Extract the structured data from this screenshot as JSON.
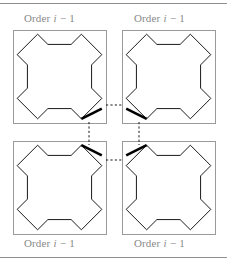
{
  "figure": {
    "title_text_parts": {
      "prefix": "Order ",
      "italic_var": "i",
      "suffix": " − 1"
    },
    "label_full": "Order i − 1",
    "quadrant_labels": [
      {
        "id": "top-left",
        "text_prefix": "Order ",
        "text_italic": "i",
        "text_suffix": " − 1"
      },
      {
        "id": "top-right",
        "text_prefix": "Order ",
        "text_italic": "i",
        "text_suffix": " − 1"
      },
      {
        "id": "bottom-left",
        "text_prefix": "Order ",
        "text_italic": "i",
        "text_suffix": " − 1"
      },
      {
        "id": "bottom-right",
        "text_prefix": "Order ",
        "text_italic": "i",
        "text_suffix": " − 1"
      }
    ],
    "colors": {
      "rule": "#8e8e8e",
      "box_border": "#9a9a9a",
      "curve": "#1a1a1a",
      "thick_segment": "#000000",
      "dashed_connector": "#1a1a1a",
      "label_text": "#8a8a8a",
      "background": "#ffffff"
    },
    "geometry": {
      "canvas_width": 227,
      "canvas_height": 264,
      "rule_top_y": 3,
      "rule_bottom_y": 257,
      "box_size": 93,
      "boxes": [
        {
          "id": "top-left",
          "x": 13,
          "y": 30
        },
        {
          "id": "top-right",
          "x": 122,
          "y": 30
        },
        {
          "id": "bottom-left",
          "x": 13,
          "y": 141
        },
        {
          "id": "bottom-right",
          "x": 122,
          "y": 141
        }
      ],
      "connector_horizontal_top": {
        "x1": 106,
        "y1": 105,
        "x2": 123,
        "y2": 105
      },
      "connector_horizontal_bottom": {
        "x1": 106,
        "y1": 160,
        "x2": 123,
        "y2": 160
      },
      "connector_vertical_left": {
        "x1": 89,
        "y1": 122,
        "x2": 89,
        "y2": 145
      },
      "connector_vertical_right": {
        "x1": 139,
        "y1": 122,
        "x2": 139,
        "y2": 145
      }
    },
    "curve_shape": {
      "description": "octagonal cross (order i-1 space-filling motif)",
      "unit_points": [
        [
          0.3,
          0.02
        ],
        [
          0.18,
          0.14
        ],
        [
          0.3,
          0.26
        ],
        [
          0.3,
          0.3
        ],
        [
          0.7,
          0.3
        ],
        [
          0.7,
          0.26
        ],
        [
          0.82,
          0.14
        ],
        [
          0.7,
          0.02
        ],
        [
          0.98,
          0.3
        ],
        [
          0.86,
          0.42
        ],
        [
          0.98,
          0.54
        ],
        [
          0.7,
          0.98
        ],
        [
          0.82,
          0.86
        ],
        [
          0.7,
          0.74
        ],
        [
          0.7,
          0.7
        ],
        [
          0.3,
          0.7
        ],
        [
          0.3,
          0.74
        ],
        [
          0.18,
          0.86
        ],
        [
          0.3,
          0.98
        ],
        [
          0.02,
          0.54
        ],
        [
          0.14,
          0.42
        ],
        [
          0.02,
          0.3
        ]
      ]
    }
  }
}
